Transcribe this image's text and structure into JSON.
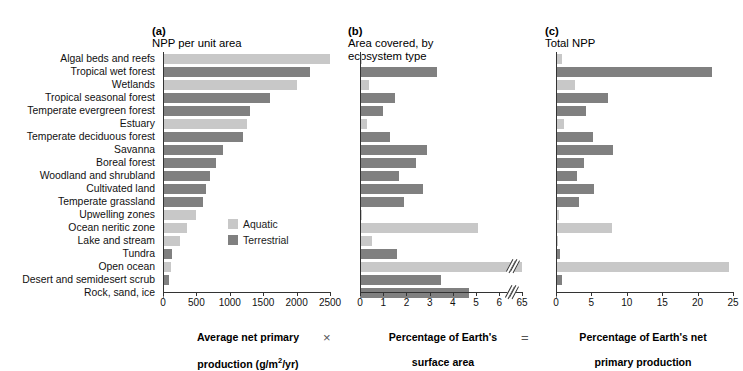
{
  "figure": {
    "operators": {
      "times": "×",
      "equals": "="
    }
  },
  "legend": {
    "position": "inside-panel-a",
    "items": [
      {
        "label": "Aquatic",
        "color": "#c8c8c8",
        "key": "aquatic"
      },
      {
        "label": "Terrestrial",
        "color": "#808080",
        "key": "terrestrial"
      }
    ]
  },
  "categories": [
    "Algal beds and reefs",
    "Tropical wet forest",
    "Wetlands",
    "Tropical seasonal forest",
    "Temperate evergreen forest",
    "Estuary",
    "Temperate deciduous forest",
    "Savanna",
    "Boreal forest",
    "Woodland and shrubland",
    "Cultivated land",
    "Temperate grassland",
    "Upwelling zones",
    "Ocean neritic zone",
    "Lake and stream",
    "Tundra",
    "Open ocean",
    "Desert and semidesert scrub",
    "Rock, sand, ice"
  ],
  "types": [
    "aquatic",
    "terrestrial",
    "aquatic",
    "terrestrial",
    "terrestrial",
    "aquatic",
    "terrestrial",
    "terrestrial",
    "terrestrial",
    "terrestrial",
    "terrestrial",
    "terrestrial",
    "aquatic",
    "aquatic",
    "aquatic",
    "terrestrial",
    "aquatic",
    "terrestrial",
    "terrestrial"
  ],
  "chart_data": [
    {
      "type": "bar",
      "panel": "a",
      "title": "(a) NPP per unit area",
      "title_prefix": "(a)",
      "title_text": "NPP per unit area",
      "orientation": "horizontal",
      "xlabel": "Average net primary production (g/m2/yr)",
      "xlabel_line1": "Average net primary",
      "xlabel_line2": "production (g/m",
      "xlabel_line2_sup": "2",
      "xlabel_line2_end": "/yr)",
      "ylabel": "",
      "xlim": [
        0,
        2500
      ],
      "ticks": [
        0,
        500,
        1000,
        1500,
        2000,
        2500
      ],
      "tick_labels": [
        "0",
        "500",
        "1000",
        "1500",
        "2000",
        "2500"
      ],
      "grid": false,
      "broken_axis": false,
      "categories": [
        "Algal beds and reefs",
        "Tropical wet forest",
        "Wetlands",
        "Tropical seasonal forest",
        "Temperate evergreen forest",
        "Estuary",
        "Temperate deciduous forest",
        "Savanna",
        "Boreal forest",
        "Woodland and shrubland",
        "Cultivated land",
        "Temperate grassland",
        "Upwelling zones",
        "Ocean neritic zone",
        "Lake and stream",
        "Tundra",
        "Open ocean",
        "Desert and semidesert scrub",
        "Rock, sand, ice"
      ],
      "values": [
        2500,
        2200,
        2000,
        1600,
        1300,
        1250,
        1200,
        900,
        800,
        700,
        650,
        600,
        500,
        360,
        250,
        140,
        125,
        90,
        3
      ]
    },
    {
      "type": "bar",
      "panel": "b",
      "title": "(b) Area covered, by ecosystem type",
      "title_prefix": "(b)",
      "title_text": "Area covered, by\necosystem type",
      "orientation": "horizontal",
      "xlabel": "Percentage of Earth's surface area",
      "xlabel_line1": "Percentage of Earth's",
      "xlabel_line2": "surface area",
      "ylabel": "",
      "xlim": [
        0,
        6
      ],
      "ticks": [
        0,
        1,
        2,
        3,
        4,
        5,
        6
      ],
      "tick_labels": [
        "0",
        "1",
        "2",
        "3",
        "4",
        "5",
        "6"
      ],
      "broken_axis": true,
      "break_after": 6,
      "break_label": "65",
      "grid": false,
      "categories": [
        "Algal beds and reefs",
        "Tropical wet forest",
        "Wetlands",
        "Tropical seasonal forest",
        "Temperate evergreen forest",
        "Estuary",
        "Temperate deciduous forest",
        "Savanna",
        "Boreal forest",
        "Woodland and shrubland",
        "Cultivated land",
        "Temperate grassland",
        "Upwelling zones",
        "Ocean neritic zone",
        "Lake and stream",
        "Tundra",
        "Open ocean",
        "Desert and semidesert scrub",
        "Rock, sand, ice"
      ],
      "values": [
        0.1,
        3.3,
        0.4,
        1.5,
        1.0,
        0.3,
        1.3,
        2.9,
        2.4,
        1.7,
        2.7,
        1.9,
        0.1,
        5.1,
        0.5,
        1.6,
        65,
        3.5,
        4.7
      ]
    },
    {
      "type": "bar",
      "panel": "c",
      "title": "(c) Total NPP",
      "title_prefix": "(c)",
      "title_text": "Total NPP",
      "orientation": "horizontal",
      "xlabel": "Percentage of Earth's net primary production",
      "xlabel_line1": "Percentage of Earth's net",
      "xlabel_line2": "primary production",
      "ylabel": "",
      "xlim": [
        0,
        25
      ],
      "ticks": [
        0,
        5,
        10,
        15,
        20,
        25
      ],
      "tick_labels": [
        "0",
        "5",
        "10",
        "15",
        "20",
        "25"
      ],
      "grid": false,
      "broken_axis": false,
      "categories": [
        "Algal beds and reefs",
        "Tropical wet forest",
        "Wetlands",
        "Tropical seasonal forest",
        "Temperate evergreen forest",
        "Estuary",
        "Temperate deciduous forest",
        "Savanna",
        "Boreal forest",
        "Woodland and shrubland",
        "Cultivated land",
        "Temperate grassland",
        "Upwelling zones",
        "Ocean neritic zone",
        "Lake and stream",
        "Tundra",
        "Open ocean",
        "Desert and semidesert scrub",
        "Rock, sand, ice"
      ],
      "values": [
        0.9,
        22.1,
        2.7,
        7.3,
        4.2,
        1.1,
        5.2,
        8.0,
        3.9,
        3.0,
        5.4,
        3.2,
        0.4,
        7.9,
        0.3,
        0.6,
        24.4,
        0.8,
        0.06
      ]
    }
  ]
}
